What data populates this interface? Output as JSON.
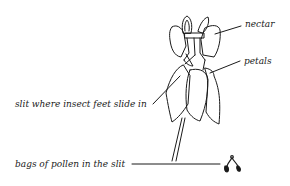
{
  "diagram": {
    "labels": {
      "nectar": "nectar",
      "petals": "petals",
      "slit": "slit where insect feet slide in",
      "pollen": "bags of pollen in the slit"
    },
    "colors": {
      "ink": "#1a1a1a",
      "background": "#ffffff"
    }
  }
}
